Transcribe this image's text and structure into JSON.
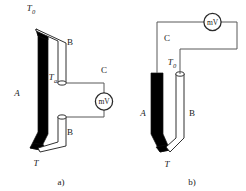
{
  "figure": {
    "background_color": "#ffffff",
    "wire_color": "#595959",
    "conductor_a_color": "#000000",
    "conductor_b_color": "#ffffff",
    "outline_color": "#1a1a1a"
  },
  "panel_a": {
    "caption": "a)",
    "labels": {
      "hot_junction": "T",
      "reference_junction_base": "T",
      "reference_junction_sub": "0",
      "ambient_base": "T",
      "ambient_sub": "a",
      "conductor_a": "A",
      "conductor_b_upper": "B",
      "conductor_b_lower": "B",
      "conductor_c": "C",
      "meter": "mV"
    }
  },
  "panel_b": {
    "caption": "b)",
    "labels": {
      "hot_junction": "T",
      "reference_junction_base": "T",
      "reference_junction_sub": "0",
      "conductor_a": "A",
      "conductor_b": "B",
      "conductor_c": "C",
      "meter": "mV"
    }
  }
}
